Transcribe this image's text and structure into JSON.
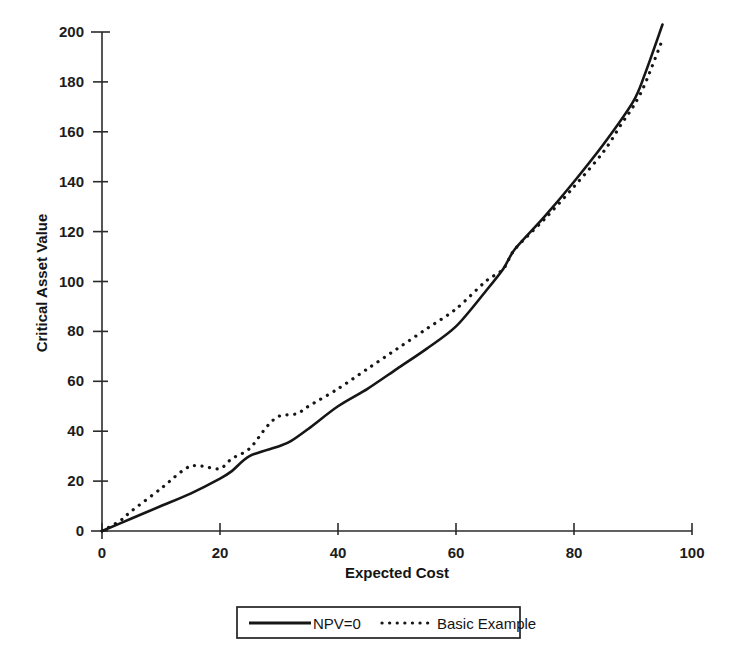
{
  "chart_data": {
    "type": "line",
    "title": "",
    "xlabel": "Expected Cost",
    "ylabel": "Critical Asset Value",
    "xlim": [
      0,
      100
    ],
    "ylim": [
      0,
      200
    ],
    "xticks": [
      0,
      20,
      40,
      60,
      80,
      100
    ],
    "yticks": [
      0,
      20,
      40,
      60,
      80,
      100,
      120,
      140,
      160,
      180,
      200
    ],
    "xtick_labels": [
      "0",
      "20",
      "40",
      "60",
      "80",
      "100"
    ],
    "ytick_labels": [
      "0",
      "20",
      "40",
      "60",
      "80",
      "100",
      "120",
      "140",
      "160",
      "180",
      "200"
    ],
    "grid": false,
    "legend_position": "below-bottom-center",
    "series": [
      {
        "name": "NPV=0",
        "style": "solid",
        "color": "#161616",
        "x": [
          0,
          5,
          10,
          15,
          20,
          22,
          25,
          30,
          32,
          35,
          40,
          45,
          50,
          55,
          60,
          65,
          68,
          70,
          75,
          80,
          85,
          90,
          92,
          95
        ],
        "values": [
          0,
          5,
          10,
          15,
          21,
          24,
          30,
          34,
          36,
          41,
          50,
          57,
          65,
          73,
          82,
          96,
          105,
          113,
          126,
          140,
          155,
          172,
          183,
          203
        ]
      },
      {
        "name": "Basic Example",
        "style": "dotted",
        "color": "#161616",
        "x": [
          0,
          3,
          5,
          10,
          13,
          15,
          17,
          20,
          22,
          25,
          28,
          30,
          33,
          35,
          40,
          45,
          50,
          55,
          60,
          65,
          68,
          70,
          75,
          80,
          85,
          88,
          90,
          92,
          95
        ],
        "values": [
          0,
          4,
          8,
          17,
          23,
          26,
          26,
          25,
          29,
          33,
          42,
          46,
          47,
          50,
          57,
          65,
          73,
          81,
          89,
          100,
          105,
          113,
          125,
          138,
          152,
          163,
          170,
          179,
          197
        ]
      }
    ],
    "annotations": []
  },
  "legend": {
    "entries": [
      {
        "label": "NPV=0",
        "marker": "solid-line"
      },
      {
        "label": "Basic Example",
        "marker": "dotted-line"
      }
    ]
  },
  "axes": {
    "x_title": "Expected Cost",
    "y_title": "Critical Asset Value"
  },
  "colors": {
    "ink": "#161616",
    "axis": "#2b2b2b",
    "background": "#ffffff"
  }
}
